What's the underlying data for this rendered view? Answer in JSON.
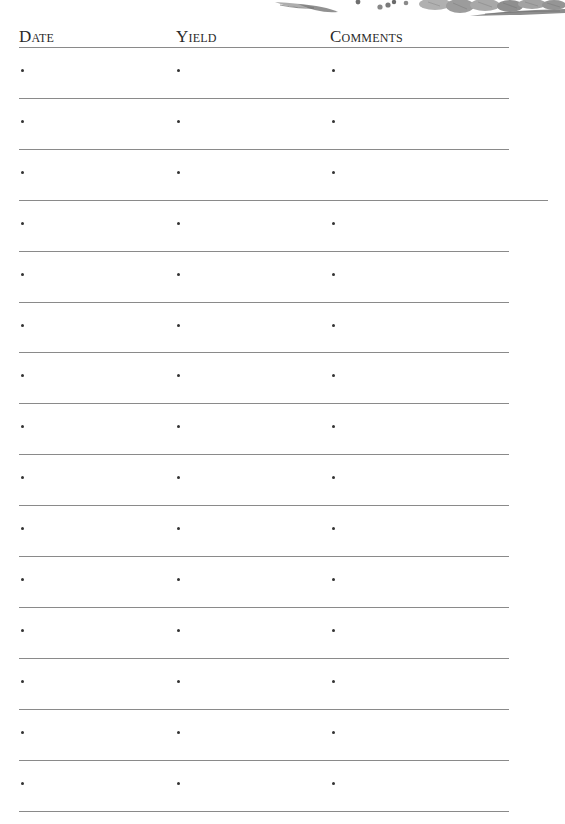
{
  "illustration": {
    "name": "engraved-vegetables-illustration",
    "tone": "grayscale"
  },
  "header": {
    "columns": [
      "Date",
      "Yield",
      "Comments"
    ]
  },
  "rows": [
    {
      "date": "",
      "yield": "",
      "comments": ""
    },
    {
      "date": "",
      "yield": "",
      "comments": ""
    },
    {
      "date": "",
      "yield": "",
      "comments": ""
    },
    {
      "date": "",
      "yield": "",
      "comments": ""
    },
    {
      "date": "",
      "yield": "",
      "comments": ""
    },
    {
      "date": "",
      "yield": "",
      "comments": ""
    },
    {
      "date": "",
      "yield": "",
      "comments": ""
    },
    {
      "date": "",
      "yield": "",
      "comments": ""
    },
    {
      "date": "",
      "yield": "",
      "comments": ""
    },
    {
      "date": "",
      "yield": "",
      "comments": ""
    },
    {
      "date": "",
      "yield": "",
      "comments": ""
    },
    {
      "date": "",
      "yield": "",
      "comments": ""
    },
    {
      "date": "",
      "yield": "",
      "comments": ""
    },
    {
      "date": "",
      "yield": "",
      "comments": ""
    },
    {
      "date": "",
      "yield": "",
      "comments": ""
    }
  ],
  "colors": {
    "rule": "#8a8a8a",
    "text": "#2a2a2a",
    "background": "#ffffff"
  }
}
